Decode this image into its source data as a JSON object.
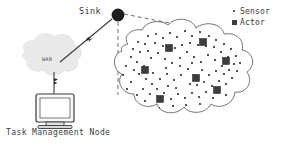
{
  "diagram": {
    "background_color": "#ffffff",
    "ink_color": "#3a3a3a"
  },
  "labels": {
    "sink": "Sink",
    "wan": "WAN",
    "task_management_node": "Task Management Node"
  },
  "legend": {
    "items": [
      {
        "symbol": "sensor-dot-icon",
        "label": "Sensor",
        "color": "#2b2b2b"
      },
      {
        "symbol": "actor-square-icon",
        "label": "Actor",
        "color": "#3d3d3d"
      }
    ]
  },
  "nodes": {
    "sink": {
      "x": 118,
      "y": 15,
      "radius": 6.5,
      "color": "#1d1d1d"
    },
    "wan_cloud": {
      "cx": 48,
      "cy": 57,
      "fill": "#e8e8e8",
      "label": "WAN"
    },
    "task_management_node": {
      "x": 55,
      "y": 108,
      "kind": "crt-monitor"
    }
  },
  "links": [
    {
      "from": "wan_cloud",
      "to": "sink",
      "style": "solid",
      "marker": "wireless-bolt"
    },
    {
      "from": "wan_cloud",
      "to": "task_management_node",
      "style": "solid",
      "marker": "wireless-bolt"
    },
    {
      "from": "sink",
      "to": "sensor_field_top",
      "style": "dashed"
    },
    {
      "from": "sink",
      "to": "sensor_field_left",
      "style": "dashed"
    }
  ],
  "sensor_field": {
    "outline": "cloud",
    "actors": [
      {
        "x": 146,
        "y": 71
      },
      {
        "x": 170,
        "y": 49
      },
      {
        "x": 204,
        "y": 43
      },
      {
        "x": 227,
        "y": 62
      },
      {
        "x": 197,
        "y": 79
      },
      {
        "x": 218,
        "y": 91
      },
      {
        "x": 161,
        "y": 100
      }
    ],
    "sensor_count": 96
  }
}
